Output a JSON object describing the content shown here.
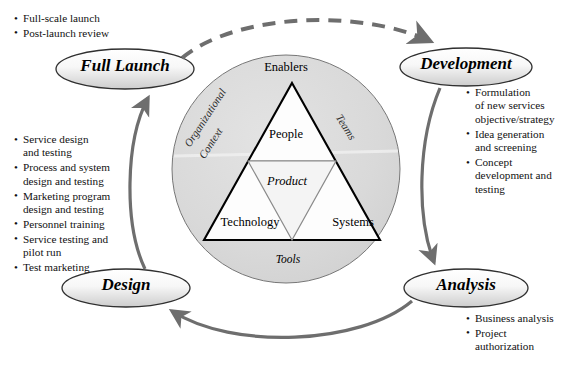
{
  "diagram": {
    "colors": {
      "circle_fill": "#d9d9d9",
      "circle_stroke": "#555555",
      "triangle_fill": "#ffffff",
      "triangle_stroke": "#000000",
      "inner_triangle_stroke": "#8a8a8a",
      "arrow": "#6e6e6e",
      "ellipse_stroke": "#333333",
      "ellipse_fill_light": "#fbfbfb",
      "ellipse_fill_dark": "#d2d2d2",
      "text": "#000000"
    }
  },
  "stages": [
    {
      "id": "full-launch",
      "label": "Full Launch",
      "bullets": [
        "Full-scale launch",
        "Post-launch review"
      ]
    },
    {
      "id": "development",
      "label": "Development",
      "bullets": [
        "Formulation\nof new services\nobjective/strategy",
        "Idea generation\nand screening",
        "Concept\ndevelopment and\ntesting"
      ]
    },
    {
      "id": "analysis",
      "label": "Analysis",
      "bullets": [
        "Business analysis",
        "Project\nauthorization"
      ]
    },
    {
      "id": "design",
      "label": "Design",
      "bullets": [
        "Service design\nand testing",
        "Process and system\ndesign and testing",
        "Marketing program\ndesign and testing",
        "Personnel training",
        "Service testing and\npilot run",
        "Test marketing"
      ]
    }
  ],
  "core": {
    "apex_label": "Enablers",
    "top_cell": "People",
    "left_cell": "Technology",
    "right_cell": "Systems",
    "center_cell": "Product",
    "ring_labels": {
      "left_line1": "Organizational",
      "left_line2": "Context",
      "right": "Teams",
      "bottom": "Tools"
    }
  },
  "flow": {
    "arrows": [
      {
        "id": "full-launch-to-development",
        "style": "dashed",
        "from": "Full Launch",
        "to": "Development"
      },
      {
        "id": "development-to-analysis",
        "style": "solid",
        "from": "Development",
        "to": "Analysis"
      },
      {
        "id": "analysis-to-design",
        "style": "solid",
        "from": "Analysis",
        "to": "Design"
      },
      {
        "id": "design-to-full-launch",
        "style": "solid",
        "from": "Design",
        "to": "Full Launch"
      }
    ]
  }
}
